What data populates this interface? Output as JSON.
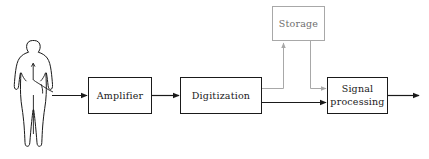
{
  "diagram": {
    "background_color": "#ffffff",
    "line_color": "#1a1a1a",
    "muted_color": "#a8a8a8",
    "nodes": [
      {
        "id": "subject",
        "type": "human-figure",
        "label": "",
        "shape": "silhouette"
      },
      {
        "id": "amplifier",
        "type": "process-box",
        "label": "Amplifier",
        "line1": "Amplifier",
        "line2": "",
        "border_color": "#1a1a1a",
        "text_color": "#1a1a1a"
      },
      {
        "id": "digitization",
        "type": "process-box",
        "label": "Digitization",
        "line1": "Digitization",
        "line2": "",
        "border_color": "#1a1a1a",
        "text_color": "#1a1a1a"
      },
      {
        "id": "storage",
        "type": "process-box",
        "label": "Storage",
        "line1": "Storage",
        "line2": "",
        "border_color": "#a8a8a8",
        "text_color": "#6e6e6e"
      },
      {
        "id": "signal-processing",
        "type": "process-box",
        "label": "Signal processing",
        "line1": "Signal",
        "line2": "processing",
        "border_color": "#1a1a1a",
        "text_color": "#1a1a1a"
      }
    ],
    "edges": [
      {
        "id": "subject-to-amplifier",
        "from": "subject",
        "to": "amplifier",
        "style": "solid",
        "color": "#1a1a1a",
        "arrow": true
      },
      {
        "id": "amplifier-to-digitization",
        "from": "amplifier",
        "to": "digitization",
        "style": "solid",
        "color": "#1a1a1a",
        "arrow": true
      },
      {
        "id": "digitization-to-storage",
        "from": "digitization",
        "to": "storage",
        "style": "solid",
        "color": "#a8a8a8",
        "arrow": true
      },
      {
        "id": "storage-to-signal-processing",
        "from": "storage",
        "to": "signal-processing",
        "style": "solid",
        "color": "#a8a8a8",
        "arrow": true
      },
      {
        "id": "digitization-to-signal-processing",
        "from": "digitization",
        "to": "signal-processing",
        "style": "solid",
        "color": "#1a1a1a",
        "arrow": true
      },
      {
        "id": "signal-processing-output",
        "from": "signal-processing",
        "to": "output",
        "style": "solid",
        "color": "#1a1a1a",
        "arrow": true
      }
    ]
  }
}
